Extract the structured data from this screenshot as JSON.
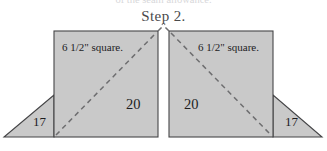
{
  "page": {
    "width": 327,
    "height": 151,
    "background_color": "#ffffff",
    "clipped_top_text": "of the seam allowance."
  },
  "title": {
    "text": "Step 2."
  },
  "colors": {
    "shape_fill": "#c9c9c9",
    "shape_stroke": "#454547",
    "dashed_line": "#6e6e70",
    "label_text": "#1d1d1f",
    "title_text": "#4a4a4c"
  },
  "figures": [
    {
      "id": "left-unit",
      "orientation": "left",
      "square_label": "6 1/2\" square.",
      "square_number": "20",
      "triangle_number": "17",
      "square": {
        "x": 54,
        "y": 31,
        "width": 104,
        "height": 106
      },
      "triangle": {
        "apex_x": 54,
        "apex_y": 95,
        "outer_x": 4,
        "base_y": 137
      },
      "diagonal": {
        "from": "bottom-left",
        "to": "top-right",
        "style": "dashed"
      }
    },
    {
      "id": "right-unit",
      "orientation": "right",
      "square_label": "6 1/2\" square.",
      "square_number": "20",
      "triangle_number": "17",
      "square": {
        "x": 169,
        "y": 31,
        "width": 104,
        "height": 106
      },
      "triangle": {
        "apex_x": 273,
        "apex_y": 95,
        "outer_x": 322,
        "base_y": 137
      },
      "diagonal": {
        "from": "top-left",
        "to": "bottom-right",
        "style": "dashed"
      }
    }
  ]
}
